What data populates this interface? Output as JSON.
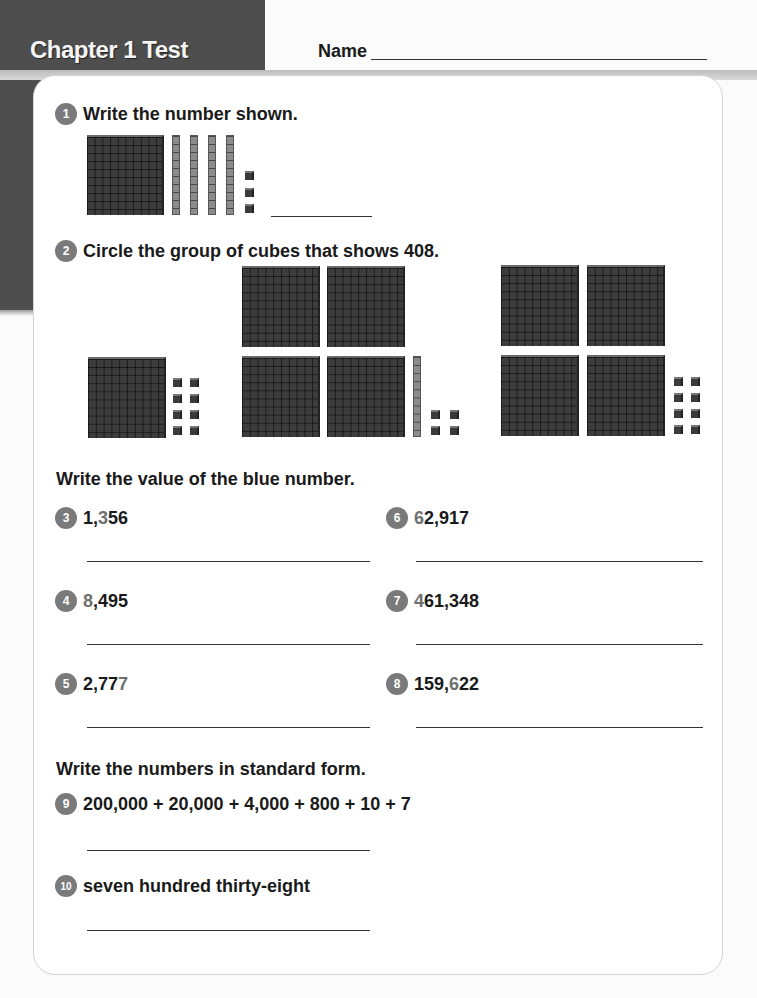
{
  "header": {
    "title": "Chapter 1  Test",
    "name_label": "Name"
  },
  "q1": {
    "number": "1",
    "prompt": "Write the number shown.",
    "blocks": {
      "hundreds": 1,
      "tens": 4,
      "ones": 3
    }
  },
  "q2": {
    "number": "2",
    "prompt": "Circle the group of cubes that shows 408.",
    "groups": [
      {
        "hundreds": 1,
        "tens": 0,
        "ones": 8
      },
      {
        "hundreds": 4,
        "tens": 1,
        "ones": 4
      },
      {
        "hundreds": 4,
        "tens": 0,
        "ones": 8
      }
    ]
  },
  "section_value": {
    "heading": "Write the value of the blue number.",
    "items": [
      {
        "number": "3",
        "pre": "1,",
        "blue": "3",
        "post": "56"
      },
      {
        "number": "4",
        "pre": "",
        "blue": "8",
        "post": ",495"
      },
      {
        "number": "5",
        "pre": "2,77",
        "blue": "7",
        "post": ""
      },
      {
        "number": "6",
        "pre": "",
        "blue": "6",
        "post": "2,917"
      },
      {
        "number": "7",
        "pre": "",
        "blue": "4",
        "post": "61,348"
      },
      {
        "number": "8",
        "pre": "159,",
        "blue": "6",
        "post": "22"
      }
    ]
  },
  "section_standard": {
    "heading": "Write the numbers in standard form.",
    "items": [
      {
        "number": "9",
        "text": "200,000 + 20,000 + 4,000 + 800 + 10 + 7"
      },
      {
        "number": "10",
        "text": "seven hundred thirty-eight"
      }
    ]
  },
  "colors": {
    "panel": "#4e4e4e",
    "badge": "#7a7a7a",
    "blue_digit_rendered": "#707070"
  }
}
